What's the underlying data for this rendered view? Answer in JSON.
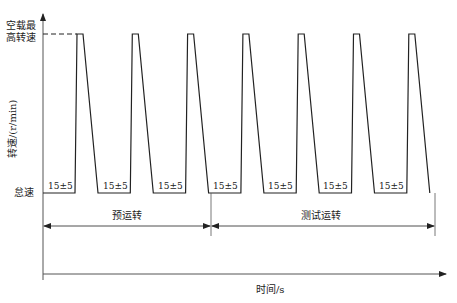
{
  "chart_data": {
    "type": "line",
    "title": "",
    "xlabel": "时间/s",
    "ylabel": "转速/(r/min)",
    "y_levels": [
      {
        "name": "怠速",
        "label": "怠速"
      },
      {
        "name": "空载最高转速",
        "label": "空载最高转速",
        "label_lines": [
          "空载最",
          "高转速"
        ]
      }
    ],
    "cycle_count": 7,
    "idle_hold_label": "15±5",
    "idle_hold_labels": [
      "15±5",
      "15±5",
      "15±5",
      "15±5",
      "15±5",
      "15±5",
      "15±5",
      "15±5"
    ],
    "phases": [
      {
        "name": "预运转",
        "cycles": 3
      },
      {
        "name": "测试运转",
        "cycles": 4
      }
    ],
    "grid": false,
    "legend": null
  },
  "labels": {
    "ymax_line1": "空载最",
    "ymax_line2": "高转速",
    "idle": "怠速",
    "ylabel": "转速/(r/min)",
    "xlabel": "时间/s",
    "phase1": "预运转",
    "phase2": "测试运转"
  },
  "colors": {
    "line": "#222222",
    "axis": "#555555",
    "background": "#ffffff"
  }
}
